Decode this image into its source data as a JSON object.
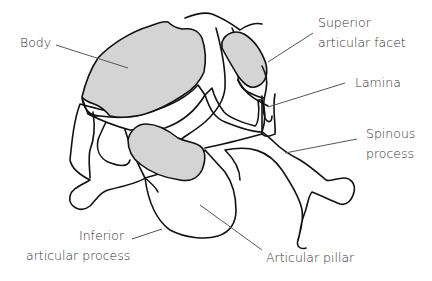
{
  "diagram": {
    "colors": {
      "facet_fill": "#d4d4d4",
      "outline": "#111111",
      "leader": "#555555",
      "label_text": "#333333",
      "background": "#ffffff"
    },
    "labels": {
      "body": "Body",
      "superior_articular_facet_line1": "Superior",
      "superior_articular_facet_line2": "articular facet",
      "lamina": "Lamina",
      "spinous_process_line1": "Spinous",
      "spinous_process_line2": "process",
      "inferior_articular_process_line1": "Inferior",
      "inferior_articular_process_line2": "articular process",
      "articular_pillar": "Articular pillar"
    }
  }
}
